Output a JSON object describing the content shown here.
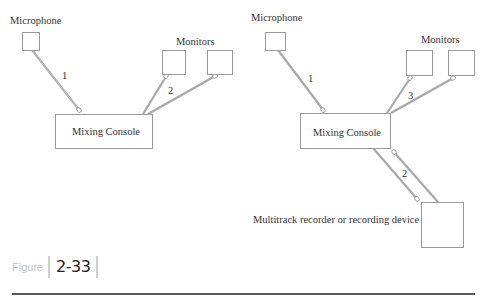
{
  "figure": {
    "label": "Figure",
    "number": "2-33"
  },
  "left_diagram": {
    "microphone_label": "Microphone",
    "monitors_label": "Monitors",
    "console_label": "Mixing Console",
    "cable_labels": [
      "1",
      "2"
    ]
  },
  "right_diagram": {
    "microphone_label": "Microphone",
    "monitors_label": "Monitors",
    "console_label": "Mixing Console",
    "recorder_label": "Multitrack recorder or recording device",
    "cable_labels": [
      "1",
      "3",
      "2"
    ]
  },
  "colors": {
    "box_stroke": "#9a9a9a",
    "cable": "#a8a8a8",
    "text": "#333333",
    "figure_label": "#c4c4c4",
    "rule": "#5a5a5a"
  }
}
